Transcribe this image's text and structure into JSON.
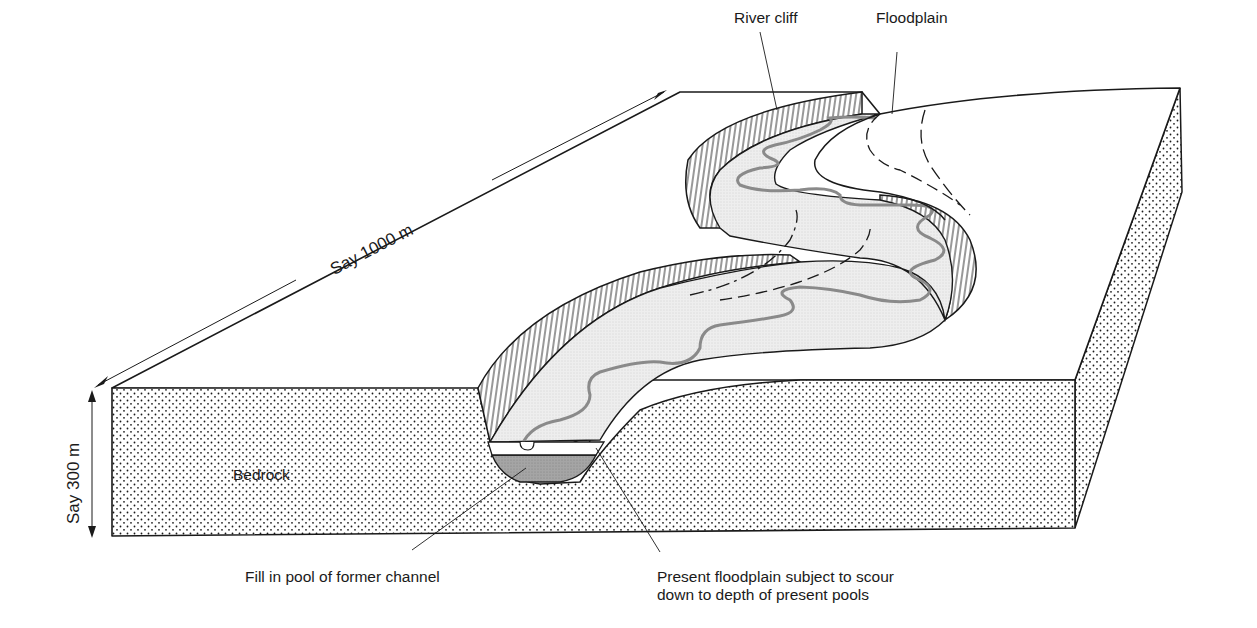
{
  "diagram": {
    "dimensions": {
      "length_label": "Say 1000 m",
      "depth_label": "Say 300 m"
    },
    "labels": {
      "river_cliff": "River cliff",
      "floodplain": "Floodplain",
      "bedrock": "Bedrock",
      "fill": "Fill in pool of former channel",
      "present_floodplain_line1": "Present floodplain subject to scour",
      "present_floodplain_line2": "down to depth of present pools"
    },
    "colors": {
      "ink": "#1a1a1a",
      "channel_line": "#8a8a8a",
      "floodplain_fill": "#eeeeee",
      "fill_deposit": "#9a9a9a",
      "background": "#ffffff"
    }
  }
}
